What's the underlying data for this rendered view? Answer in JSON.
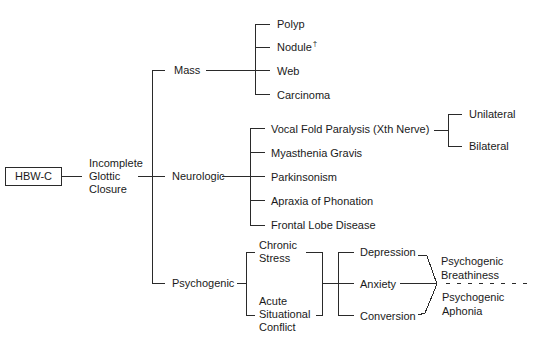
{
  "diagram": {
    "root": {
      "label": "HBW-C"
    },
    "level1": {
      "line1": "Incomplete",
      "line2": "Glottic",
      "line3": "Closure"
    },
    "categories": [
      {
        "label": "Mass",
        "children": [
          {
            "label": "Polyp"
          },
          {
            "label": "Nodule",
            "footnote": "†"
          },
          {
            "label": "Web"
          },
          {
            "label": "Carcinoma"
          }
        ]
      },
      {
        "label": "Neurologic",
        "children": [
          {
            "label": "Vocal Fold Paralysis (Xth Nerve)",
            "children": [
              {
                "label": "Unilateral"
              },
              {
                "label": "Bilateral"
              }
            ]
          },
          {
            "label": "Myasthenia Gravis"
          },
          {
            "label": "Parkinsonism"
          },
          {
            "label": "Apraxia of Phonation"
          },
          {
            "label": "Frontal Lobe Disease"
          }
        ]
      },
      {
        "label": "Psychogenic",
        "causes": [
          {
            "line1": "Chronic",
            "line2": "Stress"
          },
          {
            "line1": "Acute",
            "line2": "Situational",
            "line3": "Conflict"
          }
        ],
        "states": [
          {
            "label": "Depression"
          },
          {
            "label": "Anxiety"
          },
          {
            "label": "Conversion"
          }
        ],
        "outcomes": [
          {
            "line1": "Psychogenic",
            "line2": "Breathiness"
          },
          {
            "line1": "Psychogenic",
            "line2": "Aphonia"
          }
        ]
      }
    ]
  }
}
